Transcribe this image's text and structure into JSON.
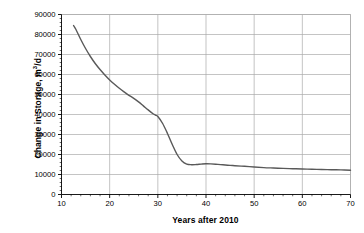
{
  "chart_data": {
    "type": "line",
    "title": "",
    "xlabel": "Years after 2010",
    "ylabel_text": "Change in Storage, m",
    "ylabel_sup": "3",
    "ylabel_tail": "/d",
    "ylabel_full": "Change in Storage, m3/d",
    "xlim": [
      10,
      70
    ],
    "ylim": [
      0,
      90000
    ],
    "grid": "both",
    "legend": "none",
    "line_color": "#595959",
    "axis_color": "#000000",
    "grid_color": "#aaaaaa",
    "xticks": [
      10,
      20,
      30,
      40,
      50,
      60,
      70
    ],
    "xtick_labels": [
      "10",
      "20",
      "30",
      "40",
      "50",
      "60",
      "70"
    ],
    "yticks": [
      0,
      10000,
      20000,
      30000,
      40000,
      50000,
      60000,
      70000,
      80000,
      90000
    ],
    "ytick_labels": [
      "0",
      "10000",
      "20000",
      "30000",
      "40000",
      "50000",
      "60000",
      "70000",
      "80000",
      "90000"
    ],
    "x": [
      12.5,
      13,
      14,
      15,
      16,
      17,
      18,
      19,
      20,
      21,
      22,
      23,
      24,
      25,
      26,
      27,
      28,
      29,
      29.5,
      30,
      31,
      32,
      33,
      34,
      35,
      36,
      37,
      38,
      39,
      40,
      41,
      42,
      43,
      44,
      45,
      46,
      48,
      50,
      52,
      54,
      56,
      58,
      60,
      62,
      64,
      66,
      68,
      70
    ],
    "y": [
      84500,
      82500,
      77500,
      73000,
      69000,
      65500,
      62500,
      59800,
      57300,
      55100,
      53100,
      51300,
      49600,
      48100,
      46300,
      44300,
      42300,
      40400,
      39700,
      39000,
      35500,
      30500,
      25000,
      20000,
      16800,
      15200,
      14900,
      15000,
      15200,
      15350,
      15300,
      15150,
      14950,
      14750,
      14550,
      14400,
      14100,
      13750,
      13450,
      13250,
      13050,
      12900,
      12750,
      12650,
      12500,
      12400,
      12300,
      12150
    ]
  }
}
